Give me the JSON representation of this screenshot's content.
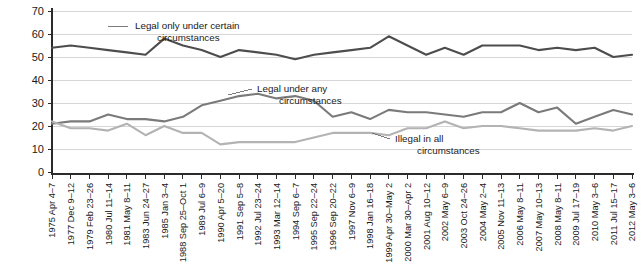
{
  "chart_data": {
    "type": "line",
    "title": "",
    "xlabel": "",
    "ylabel": "",
    "ylim": [
      0,
      70
    ],
    "ytick_step": 10,
    "yticks": [
      0,
      10,
      20,
      30,
      40,
      50,
      60,
      70
    ],
    "grid": true,
    "legend_position": "inline-annotations",
    "categories": [
      "1975 Apr 4–7",
      "1977 Dec 9–12",
      "1979 Feb 23–26",
      "1980 Jul 11–14",
      "1981 May 8–11",
      "1983 Jun 24–27",
      "1985 Jan 3–4",
      "1988 Sep 25–Oct 1",
      "1989 Jul 6–9",
      "1990 Apr 5–20",
      "1991 Sep 5–8",
      "1992 Jul 23–24",
      "1993 Mar 12–14",
      "1994 Sep 6–7",
      "1995 Sep 22–24",
      "1996 Sep 20–22",
      "1997 Nov 6–9",
      "1998 Jan 16–18",
      "1999 Apr 30–May 2",
      "2000 Mar 30–Apr 2",
      "2001 Aug 10–12",
      "2002 May 6–9",
      "2003 Oct 24–26",
      "2004 May 2–4",
      "2005 Nov 11–13",
      "2006 May 8–11",
      "2007 May 10–13",
      "2008 May 8–11",
      "2009 Jul 17–19",
      "2010 May 3–6",
      "2011 Jul 15–17",
      "2012 May 3–6"
    ],
    "series": [
      {
        "name": "Legal only under certain circumstances",
        "color": "#4d4d4d",
        "values": [
          54,
          55,
          54,
          53,
          52,
          51,
          58,
          55,
          53,
          50,
          53,
          52,
          51,
          49,
          51,
          52,
          53,
          54,
          59,
          55,
          51,
          54,
          51,
          55,
          55,
          55,
          53,
          54,
          53,
          54,
          50,
          51
        ]
      },
      {
        "name": "Legal under any circumstances",
        "color": "#7a7a7a",
        "values": [
          21,
          22,
          22,
          25,
          23,
          23,
          22,
          24,
          29,
          31,
          33,
          34,
          32,
          33,
          31,
          24,
          26,
          23,
          27,
          26,
          26,
          25,
          24,
          26,
          26,
          30,
          26,
          28,
          21,
          24,
          27,
          25
        ]
      },
      {
        "name": "Illegal in all circumstances",
        "color": "#b3b3b3",
        "values": [
          22,
          19,
          19,
          18,
          21,
          16,
          20,
          17,
          17,
          12,
          13,
          13,
          13,
          13,
          15,
          17,
          17,
          17,
          16,
          19,
          19,
          22,
          19,
          20,
          20,
          19,
          18,
          18,
          18,
          19,
          18,
          20
        ]
      }
    ],
    "annotations": [
      {
        "text_line1": "Legal only under certain",
        "text_line2": "circumstances",
        "series": "Legal only under certain circumstances"
      },
      {
        "text_line1": "Legal under any",
        "text_line2": "circumstances",
        "series": "Legal under any circumstances"
      },
      {
        "text_line1": "Illegal in all",
        "text_line2": "circumstances",
        "series": "Illegal in all circumstances"
      }
    ]
  }
}
